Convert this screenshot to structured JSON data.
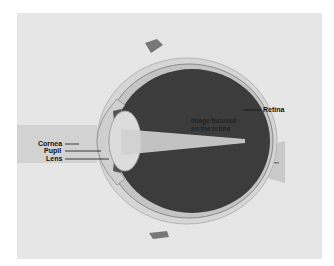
{
  "diagram": {
    "labels": {
      "cornea": "Cornea",
      "pupil": "Pupil",
      "lens": "Lens",
      "retina": "Retina",
      "image_line1": "Image focused",
      "image_line2": "on the retina"
    },
    "colors": {
      "background": "#e6e6e6",
      "eye_interior": "#3a3a3a",
      "sclera": "#cfcfcf",
      "light_beam": "#d4d4d4",
      "label_text": "#111111"
    }
  }
}
